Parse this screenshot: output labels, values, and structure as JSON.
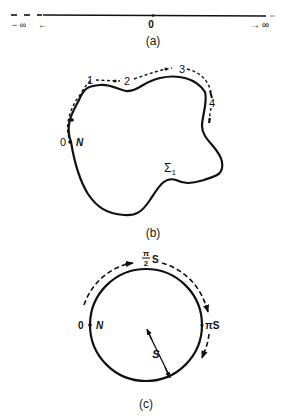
{
  "figure_a": {
    "caption": "(a)",
    "origin_label": "0",
    "left_label": "− ∞",
    "left_arrow": "←",
    "right_arrow": "→",
    "right_label": "∞"
  },
  "figure_b": {
    "caption": "(b)",
    "start_label": "0",
    "start_point_label": "N",
    "path_points": [
      "1",
      "2",
      "3",
      "4"
    ],
    "surface_label": "Σ",
    "surface_subscript": "1"
  },
  "figure_c": {
    "caption": "(c)",
    "start_label": "0",
    "start_point_label": "N",
    "quarter_label_num": "π",
    "quarter_label_den": "2",
    "quarter_label_suffix": "S",
    "half_label": "πS",
    "radius_label": "S"
  },
  "colors": {
    "ink": "#111111",
    "background": "#ffffff"
  }
}
